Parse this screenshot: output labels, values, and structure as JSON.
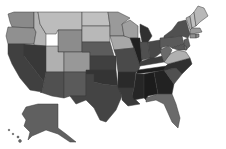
{
  "map": {
    "type": "choropleth",
    "region": "United States",
    "color_scale": "grayscale",
    "legend": null,
    "title": null,
    "states": [
      {
        "id": "WA",
        "shade": "#8a8a8a"
      },
      {
        "id": "OR",
        "shade": "#909090"
      },
      {
        "id": "CA",
        "shade": "#404040"
      },
      {
        "id": "ID",
        "shade": "#b4b4b4"
      },
      {
        "id": "NV",
        "shade": "#383838"
      },
      {
        "id": "MT",
        "shade": "#bcbcbc"
      },
      {
        "id": "WY",
        "shade": "#8c8c8c"
      },
      {
        "id": "UT",
        "shade": "#b0b0b0"
      },
      {
        "id": "CO",
        "shade": "#989898"
      },
      {
        "id": "AZ",
        "shade": "#505050"
      },
      {
        "id": "NM",
        "shade": "#5a5a5a"
      },
      {
        "id": "ND",
        "shade": "#c0c0c0"
      },
      {
        "id": "SD",
        "shade": "#b8b8b8"
      },
      {
        "id": "NE",
        "shade": "#5c5c5c"
      },
      {
        "id": "KS",
        "shade": "#404040"
      },
      {
        "id": "OK",
        "shade": "#343434"
      },
      {
        "id": "TX",
        "shade": "#444444"
      },
      {
        "id": "MN",
        "shade": "#9a9a9a"
      },
      {
        "id": "IA",
        "shade": "#a8a8a8"
      },
      {
        "id": "MO",
        "shade": "#4a4a4a"
      },
      {
        "id": "AR",
        "shade": "#2a2a2a"
      },
      {
        "id": "LA",
        "shade": "#3a3a3a"
      },
      {
        "id": "WI",
        "shade": "#a0a0a0"
      },
      {
        "id": "IL",
        "shade": "#202020"
      },
      {
        "id": "MI",
        "shade": "#303030"
      },
      {
        "id": "IN",
        "shade": "#505050"
      },
      {
        "id": "OH",
        "shade": "#484848"
      },
      {
        "id": "KY",
        "shade": "#3c3c3c"
      },
      {
        "id": "TN",
        "shade": "#1e1e1e"
      },
      {
        "id": "MS",
        "shade": "#262626"
      },
      {
        "id": "AL",
        "shade": "#1c1c1c"
      },
      {
        "id": "GA",
        "shade": "#222222"
      },
      {
        "id": "FL",
        "shade": "#6a6a6a"
      },
      {
        "id": "SC",
        "shade": "#505050"
      },
      {
        "id": "NC",
        "shade": "#303030"
      },
      {
        "id": "VA",
        "shade": "#b0b0b0"
      },
      {
        "id": "WV",
        "shade": "#6a6a6a"
      },
      {
        "id": "PA",
        "shade": "#5a5a5a"
      },
      {
        "id": "NY",
        "shade": "#505050"
      },
      {
        "id": "NJ",
        "shade": "#606060"
      },
      {
        "id": "DE",
        "shade": "#707070"
      },
      {
        "id": "MD",
        "shade": "#585858"
      },
      {
        "id": "VT",
        "shade": "#a8a8a8"
      },
      {
        "id": "NH",
        "shade": "#c0c0c0"
      },
      {
        "id": "ME",
        "shade": "#b8b8b8"
      },
      {
        "id": "MA",
        "shade": "#9a9a9a"
      },
      {
        "id": "CT",
        "shade": "#909090"
      },
      {
        "id": "RI",
        "shade": "#888888"
      },
      {
        "id": "AK",
        "shade": "#606060"
      },
      {
        "id": "HI",
        "shade": "#707070"
      }
    ]
  }
}
